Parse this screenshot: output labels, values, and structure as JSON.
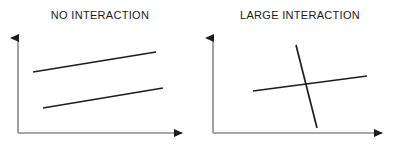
{
  "figure": {
    "width": 400,
    "height": 150,
    "background": "#ffffff",
    "line_color": "#1d1d1d",
    "axis_color": "#7a7a7a",
    "text_color": "#1a1a1a"
  },
  "panels": [
    {
      "id": "no-interaction",
      "title": "NO INTERACTION",
      "axes": {
        "origin_x": 18,
        "origin_y": 133,
        "y_top": 32,
        "x_right": 190,
        "x_axis_label": "",
        "y_axis_label": "",
        "arrowheads": true,
        "ticks": false,
        "grid": false
      },
      "series": [
        {
          "name": "upper-line",
          "x1": 33,
          "y1": 72,
          "x2": 156,
          "y2": 52
        },
        {
          "name": "lower-line",
          "x1": 43,
          "y1": 108,
          "x2": 163,
          "y2": 88
        }
      ]
    },
    {
      "id": "large-interaction",
      "title": "LARGE INTERACTION",
      "axes": {
        "origin_x": 13,
        "origin_y": 133,
        "y_top": 32,
        "x_right": 190,
        "x_axis_label": "",
        "y_axis_label": "",
        "arrowheads": true,
        "ticks": false,
        "grid": false
      },
      "series": [
        {
          "name": "steep-line",
          "x1": 96,
          "y1": 45,
          "x2": 117,
          "y2": 128
        },
        {
          "name": "shallow-line",
          "x1": 53,
          "y1": 91,
          "x2": 167,
          "y2": 76
        }
      ]
    }
  ],
  "chart_data": {
    "type": "line",
    "title": "",
    "subtitle": "",
    "xlabel": "",
    "ylabel": "",
    "grid": false,
    "legend": "none",
    "panels": [
      {
        "title": "NO INTERACTION",
        "description": "Two roughly parallel upward-sloping lines that never cross",
        "x": [
          0,
          1
        ],
        "series": [
          {
            "name": "upper-line",
            "values": [
              0.66,
              0.86
            ]
          },
          {
            "name": "lower-line",
            "values": [
              0.3,
              0.5
            ]
          }
        ],
        "xlim": [
          0,
          1
        ],
        "ylim": [
          0,
          1
        ]
      },
      {
        "title": "LARGE INTERACTION",
        "description": "One steeply descending line crossing one shallow ascending line",
        "x": [
          0,
          1
        ],
        "series": [
          {
            "name": "steep-line",
            "values": [
              0.91,
              0.08
            ]
          },
          {
            "name": "shallow-line",
            "values": [
              0.44,
              0.58
            ]
          }
        ],
        "xlim": [
          0,
          1
        ],
        "ylim": [
          0,
          1
        ]
      }
    ]
  }
}
